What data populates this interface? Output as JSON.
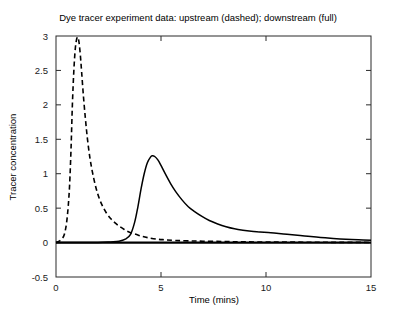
{
  "chart_data": {
    "type": "line",
    "title": "Dye tracer experiment data: upstream (dashed); downstream (full)",
    "xlabel": "Time (mins)",
    "ylabel": "Tracer concentration",
    "xlim": [
      0,
      15
    ],
    "ylim": [
      -0.5,
      3
    ],
    "xticks": [
      0,
      5,
      10,
      15
    ],
    "xticklabels": [
      "0",
      "5",
      "10",
      "15"
    ],
    "yticks": [
      -0.5,
      0,
      0.5,
      1,
      1.5,
      2,
      2.5,
      3
    ],
    "yticklabels": [
      "-0.5",
      "0",
      "0.5",
      "1",
      "1.5",
      "2",
      "2.5",
      "3"
    ],
    "grid": false,
    "legend": "none (described in title)",
    "zero_line": true,
    "series": [
      {
        "name": "upstream",
        "style": "dashed",
        "color": "#000000",
        "peak_x": 1.05,
        "peak_y": 2.98,
        "x": [
          0.0,
          0.15,
          0.3,
          0.4,
          0.5,
          0.58,
          0.65,
          0.72,
          0.78,
          0.85,
          0.92,
          0.98,
          1.02,
          1.05,
          1.1,
          1.16,
          1.22,
          1.3,
          1.4,
          1.5,
          1.62,
          1.75,
          1.9,
          2.05,
          2.2,
          2.4,
          2.6,
          2.8,
          3.0,
          3.25,
          3.5,
          3.8,
          4.1,
          4.4,
          4.8,
          5.2,
          5.7,
          6.3,
          7.0,
          8.0,
          9.0,
          10.5,
          12.0,
          13.5,
          15.0
        ],
        "y": [
          0.0,
          0.02,
          0.06,
          0.12,
          0.28,
          0.52,
          0.85,
          1.4,
          2.0,
          2.5,
          2.82,
          2.95,
          2.98,
          2.98,
          2.9,
          2.72,
          2.48,
          2.15,
          1.8,
          1.5,
          1.22,
          1.0,
          0.8,
          0.65,
          0.54,
          0.43,
          0.35,
          0.29,
          0.24,
          0.19,
          0.15,
          0.12,
          0.09,
          0.07,
          0.05,
          0.04,
          0.03,
          0.025,
          0.02,
          0.015,
          0.01,
          0.008,
          0.005,
          0.003,
          0.002
        ]
      },
      {
        "name": "downstream",
        "style": "solid",
        "color": "#000000",
        "peak_x": 4.58,
        "peak_y": 1.26,
        "x": [
          0.0,
          1.0,
          2.0,
          2.6,
          3.0,
          3.3,
          3.55,
          3.75,
          3.9,
          4.05,
          4.2,
          4.35,
          4.5,
          4.58,
          4.7,
          4.85,
          5.0,
          5.2,
          5.45,
          5.7,
          6.0,
          6.3,
          6.6,
          6.95,
          7.3,
          7.7,
          8.1,
          8.5,
          8.9,
          9.3,
          9.7,
          10.1,
          10.5,
          11.0,
          11.5,
          12.0,
          12.6,
          13.2,
          13.8,
          14.4,
          15.0
        ],
        "y": [
          0.0,
          0.0,
          0.0,
          0.01,
          0.02,
          0.05,
          0.12,
          0.3,
          0.52,
          0.78,
          1.0,
          1.16,
          1.24,
          1.26,
          1.25,
          1.2,
          1.12,
          1.0,
          0.86,
          0.74,
          0.62,
          0.52,
          0.45,
          0.38,
          0.32,
          0.27,
          0.23,
          0.2,
          0.18,
          0.165,
          0.155,
          0.145,
          0.135,
          0.12,
          0.105,
          0.09,
          0.075,
          0.06,
          0.048,
          0.04,
          0.035
        ]
      }
    ]
  }
}
